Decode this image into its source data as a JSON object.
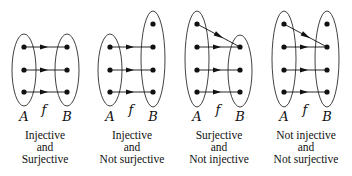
{
  "colors": {
    "ink": "#111111",
    "background": "#ffffff"
  },
  "diagrams": [
    {
      "id": "injective-surjective",
      "domain_label": "A",
      "codomain_label": "B",
      "function_label": "f",
      "caption": [
        "Injective",
        "and",
        "Surjective"
      ],
      "domain_size": 3,
      "codomain_size": 3,
      "mapping": [
        [
          1,
          1
        ],
        [
          2,
          2
        ],
        [
          3,
          3
        ]
      ],
      "cx": 45
    },
    {
      "id": "injective-not-surjective",
      "domain_label": "A",
      "codomain_label": "B",
      "function_label": "f",
      "caption": [
        "Injective",
        "and",
        "Not surjective"
      ],
      "domain_size": 3,
      "codomain_size": 4,
      "mapping": [
        [
          1,
          2
        ],
        [
          2,
          3
        ],
        [
          3,
          4
        ]
      ],
      "cx": 132
    },
    {
      "id": "surjective-not-injective",
      "domain_label": "A",
      "codomain_label": "B",
      "function_label": "f",
      "caption": [
        "Surjective",
        "and",
        "Not injective"
      ],
      "domain_size": 4,
      "codomain_size": 3,
      "mapping": [
        [
          1,
          1
        ],
        [
          2,
          1
        ],
        [
          3,
          2
        ],
        [
          4,
          3
        ]
      ],
      "cx": 219
    },
    {
      "id": "not-injective-not-surjective",
      "domain_label": "A",
      "codomain_label": "B",
      "function_label": "f",
      "caption": [
        "Not injective",
        "and",
        "Not surjective"
      ],
      "domain_size": 4,
      "codomain_size": 4,
      "mapping": [
        [
          1,
          2
        ],
        [
          2,
          2
        ],
        [
          3,
          3
        ],
        [
          4,
          4
        ]
      ],
      "cx": 306
    }
  ]
}
